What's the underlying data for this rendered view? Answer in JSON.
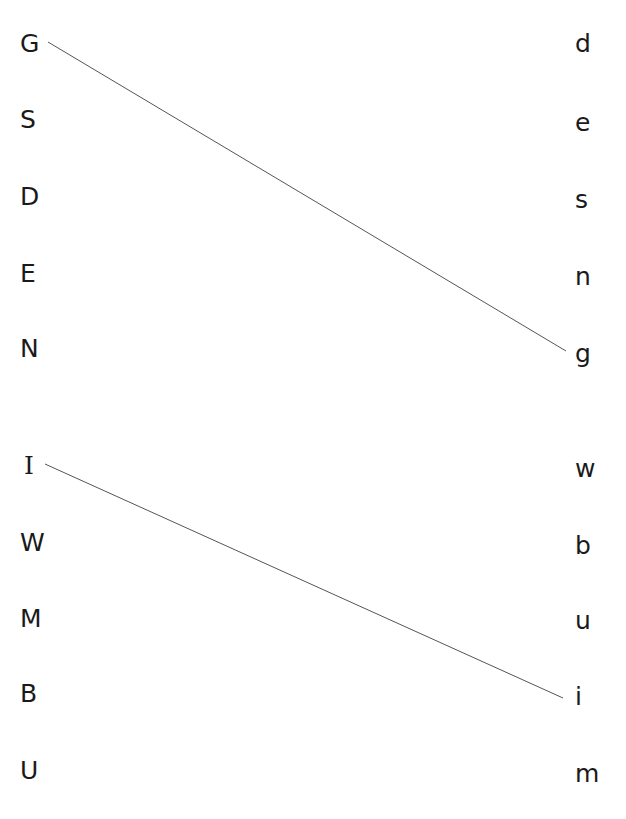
{
  "worksheet": {
    "left_column": [
      {
        "letter": "G",
        "y": 44
      },
      {
        "letter": "S",
        "y": 120
      },
      {
        "letter": "D",
        "y": 197
      },
      {
        "letter": "E",
        "y": 274
      },
      {
        "letter": "N",
        "y": 349
      },
      {
        "letter": "I",
        "y": 466
      },
      {
        "letter": "W",
        "y": 543
      },
      {
        "letter": "M",
        "y": 619
      },
      {
        "letter": "B",
        "y": 694
      },
      {
        "letter": "U",
        "y": 771
      }
    ],
    "right_column": [
      {
        "letter": "d",
        "y": 44
      },
      {
        "letter": "e",
        "y": 123
      },
      {
        "letter": "s",
        "y": 200
      },
      {
        "letter": "n",
        "y": 277
      },
      {
        "letter": "g",
        "y": 354
      },
      {
        "letter": "w",
        "y": 469
      },
      {
        "letter": "b",
        "y": 546
      },
      {
        "letter": "u",
        "y": 621
      },
      {
        "letter": "i",
        "y": 697
      },
      {
        "letter": "m",
        "y": 774
      }
    ],
    "connections": [
      {
        "from": "G",
        "to": "g",
        "x1": 48,
        "y1": 42,
        "x2": 566,
        "y2": 351
      },
      {
        "from": "I",
        "to": "i",
        "x1": 45,
        "y1": 464,
        "x2": 563,
        "y2": 698
      }
    ],
    "line_color": "#555555"
  }
}
